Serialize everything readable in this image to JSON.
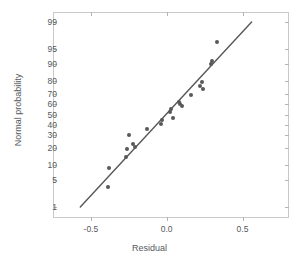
{
  "chart_data": {
    "type": "scatter",
    "title": "",
    "subtitle": "",
    "xlabel": "Residual",
    "ylabel": "Normal probability",
    "grid": false,
    "legend": null,
    "xlim": [
      -0.75,
      0.8
    ],
    "ylim_probability": [
      0.5,
      99.5
    ],
    "yscale": "normal-probability",
    "xticks": [
      -0.5,
      0.0,
      0.5
    ],
    "xtick_labels": [
      "-0.5",
      "0.0",
      "0.5"
    ],
    "yticks": [
      99,
      95,
      90,
      80,
      70,
      60,
      50,
      40,
      30,
      20,
      10,
      5,
      1
    ],
    "ytick_labels": [
      "99",
      "95",
      "90",
      "80",
      "70",
      "60",
      "50",
      "40",
      "30",
      "20",
      "10",
      "5",
      "1"
    ],
    "series": [
      {
        "name": "residual-quantiles",
        "marker": "circle",
        "color": "#585858",
        "x": [
          -0.39,
          -0.38,
          -0.27,
          -0.26,
          -0.25,
          -0.22,
          -0.21,
          -0.13,
          -0.04,
          -0.03,
          0.02,
          0.03,
          0.04,
          0.08,
          0.09,
          0.1,
          0.16,
          0.22,
          0.23,
          0.24,
          0.29,
          0.3,
          0.33
        ],
        "y": [
          3.5,
          9.0,
          14.5,
          19.5,
          30.5,
          23.0,
          21.0,
          35.5,
          41.0,
          44.5,
          53.0,
          55.5,
          46.0,
          62.5,
          60.0,
          58.5,
          68.5,
          76.0,
          79.0,
          74.0,
          90.0,
          91.0,
          96.5
        ]
      }
    ],
    "reference_line": {
      "name": "normal-reference-line",
      "color": "#585858",
      "x0": -0.57,
      "y0": 1.0,
      "x1": 0.56,
      "y1": 99.0
    }
  },
  "axes": {
    "x_title": "Residual",
    "y_title": "Normal probability"
  }
}
